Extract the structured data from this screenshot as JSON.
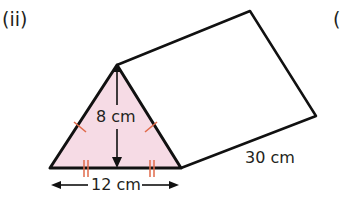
{
  "question_label": "(ii)",
  "next_label_partial": "(",
  "shape": "triangular prism",
  "labels": {
    "height": "8 cm",
    "base": "12 cm",
    "length": "30 cm"
  },
  "colors": {
    "face_fill": "#f6dbe5",
    "outline": "#111111",
    "tick_marks": "#e06a4a"
  }
}
